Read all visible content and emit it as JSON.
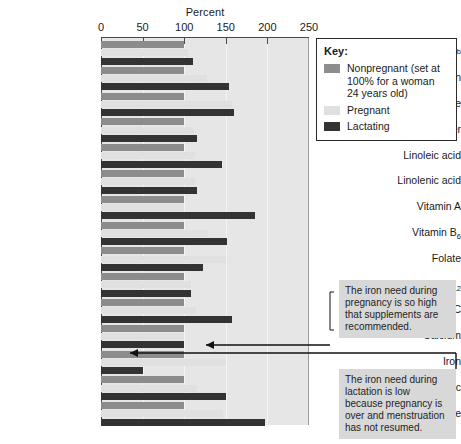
{
  "chart_data": {
    "type": "bar",
    "orientation": "horizontal",
    "title": "",
    "xlabel": "Percent",
    "ylabel": "",
    "xlim": [
      0,
      250
    ],
    "xticks": [
      0,
      50,
      100,
      150,
      200,
      250
    ],
    "grid": true,
    "legend_position": "top-right",
    "categories": [
      "Energy",
      "Protein",
      "Carbohydrate",
      "Fiber",
      "Linoleic acid",
      "Linolenic acid",
      "Vitamin A",
      "Vitamin B6",
      "Folate",
      "Vitamin B12",
      "Vitamin C",
      "Calcium",
      "Iron",
      "Zinc",
      "Iodine"
    ],
    "series": [
      {
        "name": "Nonpregnant (set at 100% for a woman 24 years old)",
        "color": "#8c8c8c",
        "values": [
          100,
          100,
          100,
          100,
          100,
          100,
          100,
          100,
          100,
          100,
          100,
          100,
          100,
          100,
          100
        ]
      },
      {
        "name": "Pregnant",
        "color": "#e0e0e0",
        "values": [
          104,
          127,
          157,
          112,
          113,
          113,
          100,
          129,
          150,
          108,
          114,
          100,
          150,
          115,
          147
        ]
      },
      {
        "name": "Lactating",
        "color": "#333333",
        "values": [
          111,
          154,
          160,
          115,
          145,
          115,
          185,
          151,
          123,
          108,
          157,
          100,
          50,
          150,
          197
        ]
      }
    ]
  },
  "axis": {
    "title": "Percent",
    "tick_labels": [
      "0",
      "50",
      "100",
      "150",
      "200",
      "250"
    ]
  },
  "categories_display": [
    {
      "text": "Energy",
      "sup": "b",
      "sub": ""
    },
    {
      "text": "Protein",
      "sup": "",
      "sub": ""
    },
    {
      "text": "Carbohydrate",
      "sup": "",
      "sub": ""
    },
    {
      "text": "Fiber",
      "sup": "",
      "sub": ""
    },
    {
      "text": "Linoleic acid",
      "sup": "",
      "sub": ""
    },
    {
      "text": "Linolenic acid",
      "sup": "",
      "sub": ""
    },
    {
      "text": "Vitamin A",
      "sup": "",
      "sub": ""
    },
    {
      "text": "Vitamin B",
      "sup": "",
      "sub": "6"
    },
    {
      "text": "Folate",
      "sup": "",
      "sub": ""
    },
    {
      "text": "Vitamin B",
      "sup": "",
      "sub": "12"
    },
    {
      "text": "Vitamin C",
      "sup": "",
      "sub": ""
    },
    {
      "text": "Calcium",
      "sup": "",
      "sub": ""
    },
    {
      "text": "Iron",
      "sup": "",
      "sub": ""
    },
    {
      "text": "Zinc",
      "sup": "",
      "sub": ""
    },
    {
      "text": "Iodine",
      "sup": "",
      "sub": ""
    }
  ],
  "legend": {
    "title": "Key:",
    "items": [
      {
        "label": "Nonpregnant (set at 100% for a woman 24 years old)",
        "color": "#8c8c8c",
        "swatch_class": "nonpregnant"
      },
      {
        "label": "Pregnant",
        "color": "#e0e0e0",
        "swatch_class": "pregnant"
      },
      {
        "label": "Lactating",
        "color": "#333333",
        "swatch_class": "lactating"
      }
    ]
  },
  "annotations": [
    {
      "id": "iron-pregnancy",
      "text": "The iron need during pregnancy is so high that supplements are recommended."
    },
    {
      "id": "iron-lactation",
      "text": "The iron need during lactation is low because pregnancy is over and menstruation has not resumed."
    }
  ],
  "colors": {
    "plot_background": "#e6e6e6",
    "gridline": "#f4f4f4",
    "axis": "#4a4a4a",
    "callout_background": "#d8d8d8",
    "nonpregnant": "#8c8c8c",
    "pregnant": "#e0e0e0",
    "lactating": "#333333"
  }
}
